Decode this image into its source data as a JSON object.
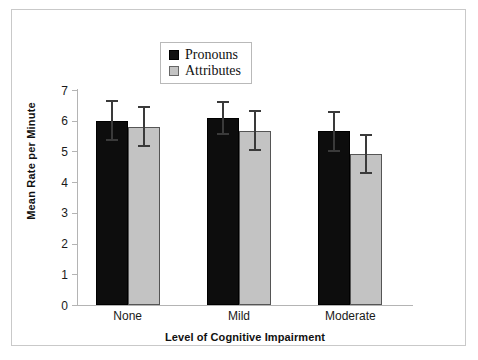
{
  "figure": {
    "background_color": "#ffffff",
    "frame_color": "#c9c9c9"
  },
  "legend": {
    "position": "top-center",
    "entries": [
      {
        "label": "Pronouns",
        "color": "#111111",
        "icon": "legend-swatch-black"
      },
      {
        "label": "Attributes",
        "color": "#c3c3c3",
        "icon": "legend-swatch-gray"
      }
    ]
  },
  "chart_data": {
    "type": "bar",
    "title": "",
    "subtitle": "",
    "xlabel": "Level of Cognitive Impairment",
    "ylabel": "Mean Rate per Minute",
    "categories": [
      "None",
      "Mild",
      "Moderate"
    ],
    "ylim": [
      0,
      7
    ],
    "yticks": [
      0,
      1,
      2,
      3,
      4,
      5,
      6,
      7
    ],
    "ytick_labels": [
      "0",
      "1",
      "2",
      "3",
      "4",
      "5",
      "6",
      "7"
    ],
    "grid": false,
    "legend_position": "top-center",
    "error_bar_type": "symmetric",
    "series": [
      {
        "name": "Pronouns",
        "color": "#111111",
        "values": [
          6.0,
          6.1,
          5.65
        ],
        "errors": [
          0.67,
          0.55,
          0.67
        ],
        "error_upper": [
          6.67,
          6.65,
          6.32
        ],
        "error_lower": [
          5.33,
          5.55,
          4.98
        ]
      },
      {
        "name": "Attributes",
        "color": "#c3c3c3",
        "values": [
          5.8,
          5.67,
          4.93
        ],
        "errors": [
          0.67,
          0.67,
          0.65
        ],
        "error_upper": [
          6.47,
          6.34,
          5.58
        ],
        "error_lower": [
          5.13,
          5.0,
          4.28
        ]
      }
    ]
  }
}
